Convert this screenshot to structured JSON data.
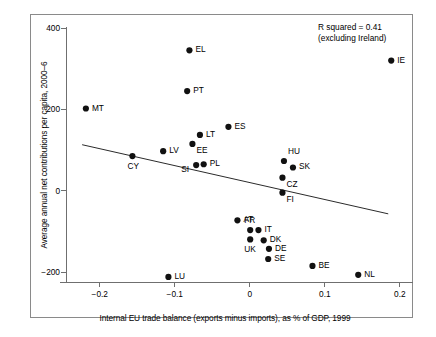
{
  "chart_data": {
    "type": "scatter",
    "title": "",
    "xlabel": "Internal EU trade balance (exports minus imports), as % of GDP, 1999",
    "ylabel": "Average annual net contributions per capita, 2000–6",
    "xlim": [
      -0.245,
      0.2175
    ],
    "ylim": [
      -245,
      420
    ],
    "xticks": [
      -0.2,
      -0.1,
      0,
      0.1,
      0.2
    ],
    "xtick_labels": [
      "−0.2",
      "−0.1",
      "0",
      "0.1",
      "0.2"
    ],
    "yticks": [
      -200,
      0,
      200,
      400
    ],
    "ytick_labels": [
      "−200",
      "0",
      "200",
      "400"
    ],
    "grid": false,
    "legend": "none",
    "annotations": [
      {
        "text_line1": "R squared = 0.41",
        "text_line2": "(excluding Ireland)"
      }
    ],
    "trendline": {
      "label": "linear fit excluding Ireland",
      "x_start": -0.2235,
      "y_start": 113,
      "x_end": 0.1845,
      "y_end": -57
    },
    "points": [
      {
        "label": "MT",
        "x": -0.2185,
        "y": 202,
        "label_dx": 6,
        "label_dy": 3
      },
      {
        "label": "CY",
        "x": -0.1565,
        "y": 85,
        "label_dx": -5,
        "label_dy": 14
      },
      {
        "label": "LV",
        "x": -0.1155,
        "y": 97,
        "label_dx": 6,
        "label_dy": 3
      },
      {
        "label": "LU",
        "x": -0.1085,
        "y": -212,
        "label_dx": 6,
        "label_dy": 3
      },
      {
        "label": "EL",
        "x": -0.0805,
        "y": 345,
        "label_dx": 6,
        "label_dy": 3
      },
      {
        "label": "PT",
        "x": -0.0835,
        "y": 245,
        "label_dx": 6,
        "label_dy": 3
      },
      {
        "label": "LT",
        "x": -0.0665,
        "y": 137,
        "label_dx": 6,
        "label_dy": 3
      },
      {
        "label": "EE",
        "x": -0.0765,
        "y": 115,
        "label_dx": 4,
        "label_dy": 10
      },
      {
        "label": "SI",
        "x": -0.0715,
        "y": 63,
        "label_dx": -15,
        "label_dy": 8
      },
      {
        "label": "PL",
        "x": -0.0615,
        "y": 65,
        "label_dx": 6,
        "label_dy": 3
      },
      {
        "label": "ES",
        "x": -0.0285,
        "y": 157,
        "label_dx": 6,
        "label_dy": 3
      },
      {
        "label": "AT",
        "x": -0.0165,
        "y": -73,
        "label_dx": 6,
        "label_dy": 3
      },
      {
        "label": "FR",
        "x": 0.0005,
        "y": -97,
        "label_dx": -6,
        "label_dy": -6
      },
      {
        "label": "UK",
        "x": 0.0005,
        "y": -120,
        "label_dx": -6,
        "label_dy": 14
      },
      {
        "label": "IT",
        "x": 0.0115,
        "y": -97,
        "label_dx": 6,
        "label_dy": 3
      },
      {
        "label": "DK",
        "x": 0.0185,
        "y": -122,
        "label_dx": 6,
        "label_dy": 3
      },
      {
        "label": "DE",
        "x": 0.0255,
        "y": -143,
        "label_dx": 6,
        "label_dy": 3
      },
      {
        "label": "SE",
        "x": 0.0245,
        "y": -168,
        "label_dx": 6,
        "label_dy": 3
      },
      {
        "label": "HU",
        "x": 0.0455,
        "y": 73,
        "label_dx": 4,
        "label_dy": -6
      },
      {
        "label": "SK",
        "x": 0.0575,
        "y": 57,
        "label_dx": 6,
        "label_dy": 3
      },
      {
        "label": "CZ",
        "x": 0.0435,
        "y": 32,
        "label_dx": 4,
        "label_dy": 10
      },
      {
        "label": "FI",
        "x": 0.0435,
        "y": -5,
        "label_dx": 4,
        "label_dy": 10
      },
      {
        "label": "BE",
        "x": 0.0835,
        "y": -185,
        "label_dx": 6,
        "label_dy": 3
      },
      {
        "label": "NL",
        "x": 0.1445,
        "y": -207,
        "label_dx": 6,
        "label_dy": 3
      },
      {
        "label": "IE",
        "x": 0.1885,
        "y": 320,
        "label_dx": 6,
        "label_dy": 3
      }
    ]
  }
}
